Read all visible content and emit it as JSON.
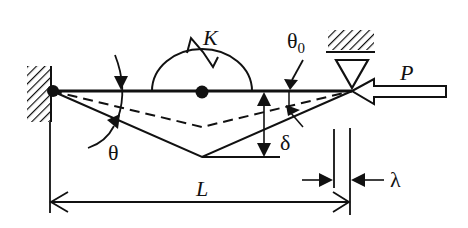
{
  "figure": {
    "type": "structural mechanics schematic"
  },
  "labels": {
    "spring_stiffness": "K",
    "load": "P",
    "initial_angle": "θ",
    "initial_angle_subscript": "0",
    "rotation_angle": "θ",
    "deflection": "δ",
    "length": "L",
    "end_shortening": "λ"
  },
  "colors": {
    "ink": "#111111",
    "background": "#ffffff"
  }
}
